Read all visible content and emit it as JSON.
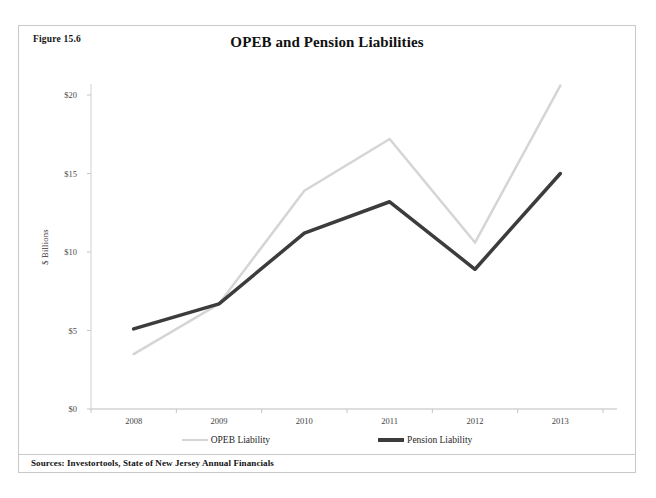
{
  "figure": {
    "number_label": "Figure 15.6",
    "source_note": "Sources: Investortools, State of New Jersey Annual Financials"
  },
  "chart_data": {
    "type": "line",
    "title": "OPEB and Pension Liabilities",
    "xlabel": "",
    "ylabel": "$ Billions",
    "categories": [
      "2008",
      "2009",
      "2010",
      "2011",
      "2012",
      "2013"
    ],
    "x_tick_labels": [
      "2008",
      "2009",
      "2010",
      "2011",
      "2012",
      "2013"
    ],
    "y_tick_labels": [
      "$0",
      "$5",
      "$10",
      "$15",
      "$20"
    ],
    "y_tick_values": [
      0,
      5,
      10,
      15,
      20
    ],
    "ylim": [
      0,
      21.5
    ],
    "grid": false,
    "legend_position": "bottom",
    "series": [
      {
        "name": "OPEB Liability",
        "color": "#d5d5d5",
        "width": 2.5,
        "values": [
          3.5,
          6.7,
          13.9,
          17.2,
          10.6,
          20.6
        ]
      },
      {
        "name": "Pension Liability",
        "color": "#3c3c3c",
        "width": 3.5,
        "values": [
          5.1,
          6.7,
          11.2,
          13.2,
          8.9,
          15.0
        ]
      }
    ]
  }
}
